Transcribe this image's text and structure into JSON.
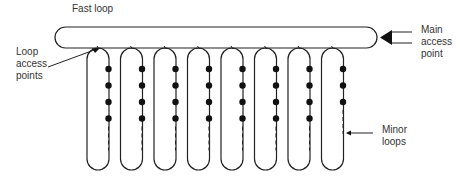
{
  "labels": {
    "fast_loop": "Fast loop",
    "loop_access_points": "Loop\naccess\npoints",
    "main_access_point": "Main\naccess\npoint",
    "minor_loops": "Minor\nloops"
  },
  "diagram": {
    "fast_loop": {
      "x": 55,
      "y": 27,
      "width": 322,
      "height": 21
    },
    "minor_loops": [
      {
        "index": 1,
        "dots": 4
      },
      {
        "index": 2,
        "dots": 4
      },
      {
        "index": 3,
        "dots": 4
      },
      {
        "index": 4,
        "dots": 4
      },
      {
        "index": 5,
        "dots": 4
      },
      {
        "index": 6,
        "dots": 4
      },
      {
        "index": 7,
        "dots": 4
      },
      {
        "index": 8,
        "dots": 3
      }
    ],
    "line_color": "#222222"
  }
}
